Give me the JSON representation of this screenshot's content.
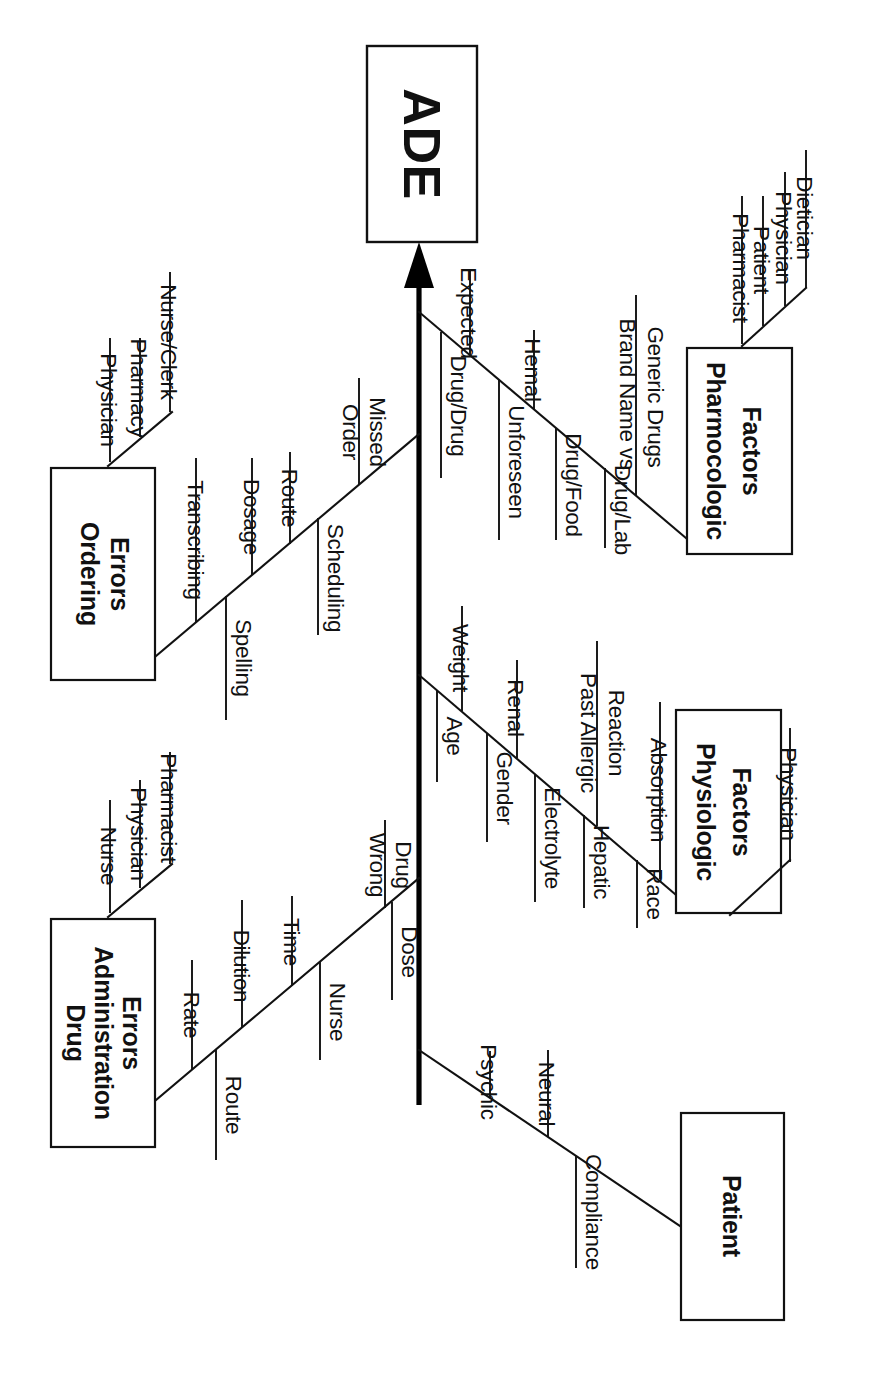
{
  "diagram": {
    "type": "fishbone-ishikawa",
    "orientation": "rotated-90-clockwise",
    "effect": {
      "label": "ADE"
    },
    "colors": {
      "line": "#111111",
      "spine": "#000000",
      "box_fill": "#ffffff",
      "text": "#111111"
    },
    "categories": [
      {
        "id": "ordering-errors",
        "label_line1": "Ordering",
        "label_line2": "Errors",
        "side": "upper-left",
        "sub_branches": [
          {
            "id": "ordering-people",
            "causes": [
              "Physician",
              "Pharmacy",
              "Nurse/Clerk"
            ]
          },
          {
            "id": "ordering-details",
            "causes": [
              "Transcribing",
              "Spelling",
              "Dosage",
              "Route",
              "Scheduling",
              "Order Missed"
            ]
          }
        ]
      },
      {
        "id": "pharmacologic-factors",
        "label_line1": "Pharmocologic",
        "label_line2": "Factors",
        "side": "upper-right",
        "sub_branches": [
          {
            "id": "pharmacologic-interactions",
            "causes": [
              "Drug/Drug",
              "Expected",
              "Unforeseen",
              "Hemal",
              "Drug/Food",
              "Drug/Lab",
              "Brand Name vs. Generic Drugs"
            ]
          },
          {
            "id": "pharmacologic-people",
            "causes": [
              "Pharmacist",
              "Patient",
              "Physician",
              "Dietician"
            ]
          }
        ]
      },
      {
        "id": "drug-administration-errors",
        "label_line1": "Drug",
        "label_line2": "Administration",
        "label_line3": "Errors",
        "side": "lower-left",
        "sub_branches": [
          {
            "id": "administration-people",
            "causes": [
              "Nurse",
              "Physician",
              "Pharmacist"
            ]
          },
          {
            "id": "administration-details",
            "causes": [
              "Rate",
              "Dilution",
              "Route",
              "Time",
              "Nurse",
              "Wrong Drug",
              "Dose"
            ]
          }
        ]
      },
      {
        "id": "physiologic-factors",
        "label_line1": "Physiologic",
        "label_line2": "Factors",
        "side": "lower-right",
        "sub_branches": [
          {
            "id": "physiologic-attributes",
            "causes": [
              "Age",
              "Weight",
              "Gender",
              "Renal",
              "Electrolyte",
              "Past Allergic Reaction",
              "Hepatic",
              "Absorption",
              "Race"
            ]
          },
          {
            "id": "physiologic-people",
            "causes": [
              "Physician"
            ]
          }
        ]
      },
      {
        "id": "patient",
        "label_line1": "Patient",
        "side": "bottom",
        "sub_branches": [
          {
            "id": "patient-factors",
            "causes": [
              "Psychic",
              "Neural",
              "Compliance"
            ]
          }
        ]
      }
    ],
    "labels": {
      "effect_text": "ADE",
      "ordering_l1": "Ordering",
      "ordering_l2": "Errors",
      "pharm_l1": "Pharmocologic",
      "pharm_l2": "Factors",
      "admin_l1": "Drug",
      "admin_l2": "Administration",
      "admin_l3": "Errors",
      "physio_l1": "Physiologic",
      "physio_l2": "Factors",
      "patient_l1": "Patient",
      "oe_physician": "Physician",
      "oe_pharmacy": "Pharmacy",
      "oe_nurseclerk": "Nurse/Clerk",
      "oe_transcribing": "Transcribing",
      "oe_spelling": "Spelling",
      "oe_dosage": "Dosage",
      "oe_route": "Route",
      "oe_scheduling": "Scheduling",
      "oe_order": "Order",
      "oe_missed": "Missed",
      "pf_drugdrug": "Drug/Drug",
      "pf_expected": "Expected",
      "pf_unforeseen": "Unforeseen",
      "pf_hemal": "Hemal",
      "pf_drugfood": "Drug/Food",
      "pf_druglab": "Drug/Lab",
      "pf_brand1": "Brand Name vs.",
      "pf_brand2": "Generic Drugs",
      "pf_pharmacist": "Pharmacist",
      "pf_patient": "Patient",
      "pf_physician": "Physician",
      "pf_dietician": "Dietician",
      "da_nurse_top": "Nurse",
      "da_physician": "Physician",
      "da_pharmacist": "Pharmacist",
      "da_rate": "Rate",
      "da_dilution": "Dilution",
      "da_route": "Route",
      "da_time": "Time",
      "da_nurse": "Nurse",
      "da_wrong": "Wrong",
      "da_drug": "Drug",
      "da_dose": "Dose",
      "ph_age": "Age",
      "ph_weight": "Weight",
      "ph_gender": "Gender",
      "ph_renal": "Renal",
      "ph_electrolyte": "Electrolyte",
      "ph_past": "Past Allergic",
      "ph_reaction": "Reaction",
      "ph_hepatic": "Hepatic",
      "ph_absorption": "Absorption",
      "ph_race": "Race",
      "ph_physician": "Physician",
      "pt_psychic": "Psychic",
      "pt_neural": "Neural",
      "pt_compliance": "Compliance"
    }
  }
}
